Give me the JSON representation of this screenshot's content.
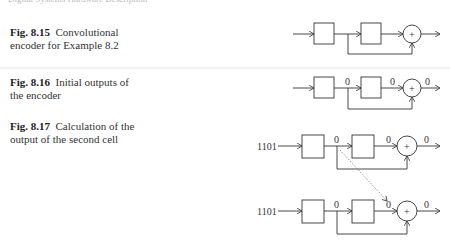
{
  "page": {
    "header_text": "Digital Systems Hardware Description"
  },
  "figures": [
    {
      "number": "Fig. 8.15",
      "caption": "Convolutional encoder for Example 8.2",
      "line1": "Convolutional",
      "line2": "encoder for Example 8.2",
      "labels": {}
    },
    {
      "number": "Fig. 8.16",
      "caption": "Initial outputs of the encoder",
      "line1": "Initial outputs of",
      "line2": "the encoder",
      "labels": {
        "mid": "0",
        "pre_xor": "0",
        "out": "0"
      }
    },
    {
      "number": "Fig. 8.17",
      "caption": "Calculation of the output of the second cell",
      "line1": "Calculation of the",
      "line2": "output of the second cell",
      "labels": {
        "top": {
          "input": "1101",
          "mid": "0",
          "pre_xor": "0",
          "out": "0"
        },
        "bottom": {
          "input": "1101",
          "mid": "0",
          "pre_xor": "0",
          "out": "0"
        }
      }
    }
  ],
  "symbols": {
    "xor": "+"
  }
}
